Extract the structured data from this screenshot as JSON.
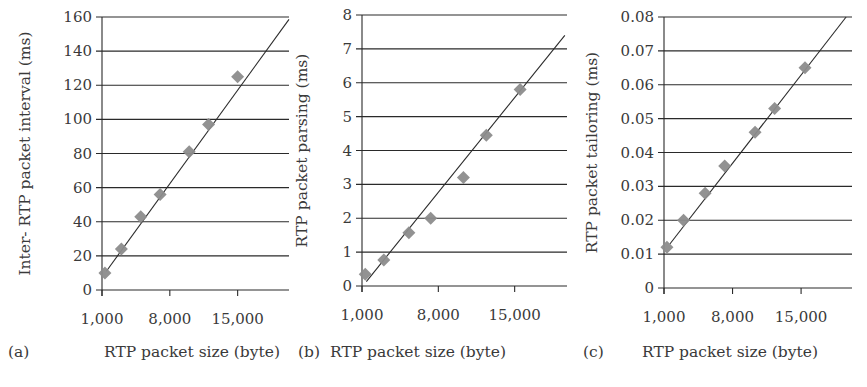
{
  "figure": {
    "panels": [
      "a",
      "b",
      "c"
    ]
  },
  "colors": {
    "marker": "#8c8c8c",
    "trend_line": "#2a2a2a",
    "grid": "#2a2a2a",
    "axis": "#2a2a2a",
    "text": "#3a3a3a"
  },
  "chart_data": [
    {
      "type": "scatter",
      "panel_label": "(a)",
      "title": "",
      "xlabel": "RTP packet size (byte)",
      "ylabel": "Inter- RTP packet interval (ms)",
      "x_tick_labels": [
        "1,000",
        "8,000",
        "15,000"
      ],
      "x_ticks": [
        1000,
        8000,
        15000
      ],
      "xlim": [
        1000,
        20300
      ],
      "y_tick_labels": [
        "0",
        "20",
        "40",
        "60",
        "80",
        "100",
        "120",
        "140",
        "160"
      ],
      "y_ticks": [
        0,
        20,
        40,
        60,
        80,
        100,
        120,
        140,
        160
      ],
      "ylim": [
        0,
        160
      ],
      "grid": "horizontal",
      "legend": "none",
      "series": [
        {
          "name": "measured",
          "marker": "diamond",
          "x": [
            1300,
            3000,
            5000,
            7000,
            10000,
            12000,
            15000
          ],
          "y": [
            10,
            24,
            43,
            56,
            81,
            97,
            125
          ]
        }
      ],
      "trend_line": {
        "type": "linear",
        "x": [
          1450,
          20300
        ],
        "y": [
          11,
          158.6
        ]
      }
    },
    {
      "type": "scatter",
      "panel_label": "(b)",
      "title": "",
      "xlabel": "RTP packet size (byte)",
      "ylabel": "RTP packet parsing (ms)",
      "x_tick_labels": [
        "1,000",
        "8,000",
        "15,000"
      ],
      "x_ticks": [
        1000,
        8000,
        15000
      ],
      "xlim": [
        1000,
        19800
      ],
      "y_tick_labels": [
        "0",
        "1",
        "2",
        "3",
        "4",
        "5",
        "6",
        "7",
        "8"
      ],
      "y_ticks": [
        0,
        1,
        2,
        3,
        4,
        5,
        6,
        7,
        8
      ],
      "ylim": [
        0,
        8
      ],
      "grid": "horizontal",
      "legend": "none",
      "series": [
        {
          "name": "measured",
          "marker": "diamond",
          "x": [
            1300,
            3000,
            5300,
            7300,
            10300,
            12400,
            15500
          ],
          "y": [
            0.35,
            0.77,
            1.57,
            2.0,
            3.2,
            4.45,
            5.8
          ]
        }
      ],
      "trend_line": {
        "type": "linear",
        "x": [
          1400,
          19600
        ],
        "y": [
          0.13,
          7.4
        ]
      }
    },
    {
      "type": "scatter",
      "panel_label": "(c)",
      "title": "",
      "xlabel": "RTP packet size (byte)",
      "ylabel": "RTP packet tailoring (ms)",
      "x_tick_labels": [
        "1,000",
        "8,000",
        "15,000"
      ],
      "x_ticks": [
        1000,
        8000,
        15000
      ],
      "xlim": [
        1000,
        20200
      ],
      "y_tick_labels": [
        "0",
        "0.01",
        "0.02",
        "0.03",
        "0.04",
        "0.05",
        "0.06",
        "0.07",
        "0.08"
      ],
      "y_ticks": [
        0,
        0.01,
        0.02,
        0.03,
        0.04,
        0.05,
        0.06,
        0.07,
        0.08
      ],
      "ylim": [
        0,
        0.08
      ],
      "grid": "horizontal",
      "legend": "none",
      "series": [
        {
          "name": "measured",
          "marker": "diamond",
          "x": [
            1300,
            3000,
            5200,
            7200,
            10300,
            12300,
            15400
          ],
          "y": [
            0.012,
            0.02,
            0.028,
            0.036,
            0.046,
            0.053,
            0.065
          ]
        }
      ],
      "trend_line": {
        "type": "linear",
        "x": [
          1600,
          19600
        ],
        "y": [
          0.013,
          0.08
        ]
      }
    }
  ]
}
